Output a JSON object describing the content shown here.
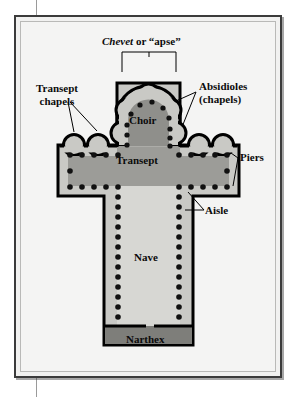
{
  "figure": {
    "type": "architectural-floor-plan",
    "title_parts": {
      "italic_word": "Chevet",
      "rest": " or “apse”"
    }
  },
  "labels": {
    "chevet": "Chevet or “apse”",
    "transept_chapels_line1": "Transept",
    "transept_chapels_line2": "chapels",
    "absidioles_line1": "Absidioles",
    "absidioles_line2": "(chapels)",
    "piers": "Piers",
    "aisle": "Aisle",
    "choir": "Choir",
    "transept": "Transept",
    "nave": "Nave",
    "narthex": "Narthex"
  },
  "colors": {
    "page_background": "#ffffff",
    "gutter_rule": "#9a9a9a",
    "frame_border": "#3b3b3b",
    "frame_fill": "#f1f1f0",
    "inner_hairline": "#b9b9b7",
    "plan_outline": "#000000",
    "aisle_fill": "#c9c9c5",
    "nave_fill": "#d7d7d3",
    "transept_fill": "#9c9c98",
    "choir_fill": "#8f8f8b",
    "narthex_fill": "#7e7e7a",
    "pier_fill": "#111111",
    "leader_line": "#000000",
    "text": "#0b0b0b"
  },
  "plan_structure": {
    "chevet": {
      "absidiole_count": 5,
      "description": "radiating chapels around the apse"
    },
    "choir": {
      "apse_shape": "semicircular",
      "pier_count": 11
    },
    "transept": {
      "arms": 2,
      "chapels_per_arm": 2,
      "pier_rows": 2
    },
    "nave": {
      "pier_columns": 2,
      "piers_per_column": 13,
      "aisles": 2
    },
    "narthex": {
      "shape": "rectangle",
      "position": "west end"
    }
  },
  "leaders": {
    "chevet_bracket": "bracket spanning the chevet above the apse",
    "transept_chapels": "two leader lines to the left transept chapels",
    "absidioles": "two leader lines to the apse chapels",
    "piers": "two leader lines to transept pier rows",
    "aisle": "one leader line to the nave aisle"
  }
}
